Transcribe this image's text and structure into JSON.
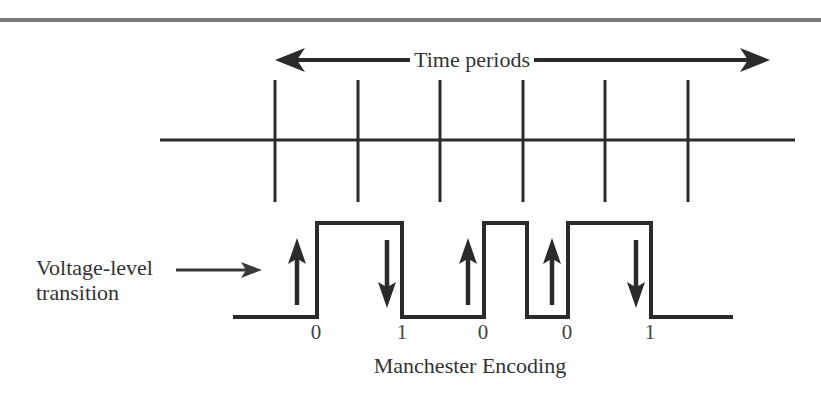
{
  "figure": {
    "top_rule": {
      "color": "#7b7b7b",
      "y": 20,
      "x1": 0,
      "x2": 821,
      "thickness": 4
    },
    "stroke_color": "#2b2b2b",
    "text_color": "#333333",
    "background": "#ffffff"
  },
  "time_axis": {
    "label": "Time periods",
    "label_x": 472,
    "label_y": 47,
    "arrow": {
      "x1": 275,
      "x2": 770,
      "y": 60
    },
    "baseline": {
      "x1": 160,
      "x2": 795,
      "y": 140
    },
    "tick_top": 80,
    "tick_bottom": 202,
    "tick_positions": [
      275,
      358,
      440,
      523,
      605,
      688
    ]
  },
  "annotation": {
    "line1": "Voltage-level",
    "line2": "transition",
    "x": 36,
    "y": 255,
    "pointer": {
      "x1": 176,
      "x2": 262,
      "y": 270
    }
  },
  "waveform": {
    "caption": "Manchester Encoding",
    "caption_x": 470,
    "caption_y": 353,
    "start_x": 233,
    "end_x": 733,
    "high_y": 223,
    "low_y": 317,
    "edges": [
      {
        "x": 317,
        "dir": "rise"
      },
      {
        "x": 402,
        "dir": "fall"
      },
      {
        "x": 484,
        "dir": "rise"
      },
      {
        "x": 527,
        "dir": "fall"
      },
      {
        "x": 568,
        "dir": "rise"
      },
      {
        "x": 651,
        "dir": "fall"
      }
    ],
    "transition_arrows": [
      {
        "x": 297,
        "dir": "up",
        "y_top": 238,
        "y_bottom": 305
      },
      {
        "x": 387,
        "dir": "down",
        "y_top": 240,
        "y_bottom": 308
      },
      {
        "x": 468,
        "dir": "up",
        "y_top": 238,
        "y_bottom": 305
      },
      {
        "x": 552,
        "dir": "up",
        "y_top": 238,
        "y_bottom": 305
      },
      {
        "x": 636,
        "dir": "down",
        "y_top": 240,
        "y_bottom": 308
      }
    ],
    "bit_labels": [
      {
        "value": "0",
        "x": 316,
        "y": 320
      },
      {
        "value": "1",
        "x": 402,
        "y": 320
      },
      {
        "value": "0",
        "x": 483,
        "y": 320
      },
      {
        "value": "0",
        "x": 567,
        "y": 320
      },
      {
        "value": "1",
        "x": 650,
        "y": 320
      }
    ],
    "bit_sequence": "0 1 0 0 1"
  }
}
